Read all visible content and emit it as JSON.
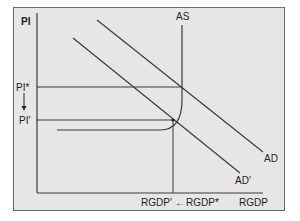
{
  "diagram": {
    "type": "AS-AD model",
    "colors": {
      "panel_background": "#e6e6e6",
      "panel_border": "#6a6a6a",
      "line": "#3a3a3a",
      "page_background": "#ffffff"
    },
    "axes": {
      "y_label": "PI",
      "x_label": "RGDP"
    },
    "curves": {
      "as_label": "AS",
      "ad_label": "AD",
      "ad_prime_label": "AD′"
    },
    "price_levels": {
      "initial": "PI*",
      "new": "PI′"
    },
    "output_levels": {
      "initial": "RGDP*",
      "new": "RGDP′",
      "arrow": "←"
    }
  }
}
